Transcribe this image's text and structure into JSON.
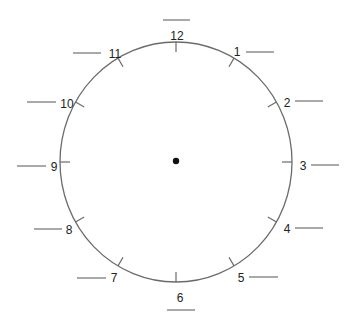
{
  "worksheet": {
    "type": "clock-face-fill-in",
    "colors": {
      "outline": "#6b6b6b",
      "text": "#222222",
      "blank_line": "#555555",
      "center": "#111111"
    },
    "numbers": [
      {
        "label": "12",
        "x": 177,
        "y": 36,
        "blank": {
          "x1": 163,
          "x2": 190,
          "y": 20
        }
      },
      {
        "label": "1",
        "x": 237,
        "y": 52,
        "blank": {
          "x1": 246,
          "x2": 274,
          "y": 52
        }
      },
      {
        "label": "2",
        "x": 287,
        "y": 103,
        "blank": {
          "x1": 295,
          "x2": 323,
          "y": 101
        }
      },
      {
        "label": "3",
        "x": 303,
        "y": 166,
        "blank": {
          "x1": 311,
          "x2": 339,
          "y": 165
        }
      },
      {
        "label": "4",
        "x": 287,
        "y": 229,
        "blank": {
          "x1": 295,
          "x2": 323,
          "y": 228
        }
      },
      {
        "label": "5",
        "x": 241,
        "y": 278,
        "blank": {
          "x1": 249,
          "x2": 278,
          "y": 277
        }
      },
      {
        "label": "6",
        "x": 180,
        "y": 298,
        "blank": {
          "x1": 167,
          "x2": 195,
          "y": 310
        }
      },
      {
        "label": "7",
        "x": 114,
        "y": 278,
        "blank": {
          "x1": 77,
          "x2": 106,
          "y": 278
        }
      },
      {
        "label": "8",
        "x": 69,
        "y": 230,
        "blank": {
          "x1": 34,
          "x2": 62,
          "y": 229
        }
      },
      {
        "label": "9",
        "x": 54,
        "y": 167,
        "blank": {
          "x1": 17,
          "x2": 46,
          "y": 166
        }
      },
      {
        "label": "10",
        "x": 67,
        "y": 104,
        "blank": {
          "x1": 27,
          "x2": 56,
          "y": 102
        }
      },
      {
        "label": "11",
        "x": 115,
        "y": 54,
        "blank": {
          "x1": 73,
          "x2": 101,
          "y": 53
        }
      }
    ]
  }
}
